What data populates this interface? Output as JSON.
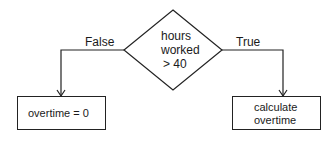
{
  "diagram": {
    "type": "flowchart",
    "decision": {
      "lines": [
        "hours",
        "worked",
        "> 40"
      ]
    },
    "branches": {
      "false": {
        "label": "False",
        "target": "overtime = 0"
      },
      "true": {
        "label": "True",
        "target_lines": [
          "calculate",
          "overtime"
        ]
      }
    },
    "colors": {
      "stroke": "#222222",
      "background": "#ffffff"
    }
  }
}
